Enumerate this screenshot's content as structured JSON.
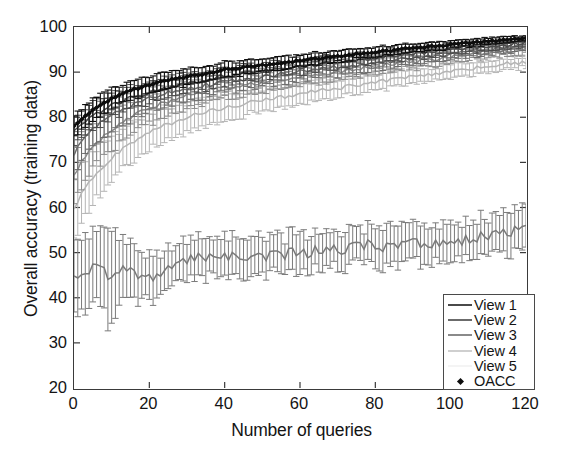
{
  "chart_data": {
    "type": "line",
    "title": "",
    "xlabel": "Number of queries",
    "ylabel": "Overall accuracy (training data)",
    "xlim": [
      0,
      120
    ],
    "ylim": [
      20,
      100
    ],
    "xticks": [
      0,
      20,
      40,
      60,
      80,
      100,
      120
    ],
    "yticks": [
      20,
      30,
      40,
      50,
      60,
      70,
      80,
      90,
      100
    ],
    "grid": false,
    "legend_position": "bottom-right",
    "error_bars": true,
    "error_bar_style": "vertical capped (std. deviation)",
    "x": [
      0,
      2,
      4,
      6,
      8,
      10,
      12,
      14,
      16,
      18,
      20,
      24,
      28,
      32,
      36,
      40,
      44,
      48,
      52,
      56,
      60,
      64,
      68,
      72,
      76,
      80,
      84,
      88,
      92,
      96,
      100,
      104,
      108,
      112,
      116,
      120
    ],
    "series": [
      {
        "name": "OACC",
        "color": "#0d0d0d",
        "marker": "diamond",
        "values": [
          78.0,
          79.6,
          81.0,
          82.2,
          83.2,
          84.1,
          84.9,
          85.6,
          86.2,
          86.7,
          87.2,
          88.0,
          88.7,
          89.3,
          89.8,
          90.6,
          90.9,
          91.4,
          91.7,
          92.2,
          92.5,
          92.9,
          93.3,
          93.7,
          94.1,
          94.5,
          94.8,
          95.2,
          95.5,
          95.8,
          96.1,
          96.4,
          96.7,
          96.9,
          97.2,
          97.4
        ],
        "err": [
          2.6,
          2.5,
          2.5,
          2.4,
          2.3,
          2.2,
          2.1,
          2.1,
          2.0,
          2.0,
          1.9,
          1.8,
          1.8,
          1.7,
          1.6,
          1.6,
          1.5,
          1.5,
          1.4,
          1.4,
          1.3,
          1.3,
          1.2,
          1.2,
          1.1,
          1.1,
          1.0,
          1.0,
          0.9,
          0.9,
          0.8,
          0.8,
          0.7,
          0.7,
          0.6,
          0.5
        ]
      },
      {
        "name": "View 1",
        "color": "#4a4a4a",
        "marker": "none",
        "values": [
          77.0,
          78.5,
          79.8,
          80.9,
          81.8,
          82.6,
          83.3,
          84.0,
          84.6,
          85.1,
          85.6,
          86.4,
          87.1,
          87.7,
          88.3,
          89.2,
          89.5,
          90.0,
          90.4,
          90.9,
          91.2,
          91.6,
          92.0,
          92.4,
          92.8,
          93.2,
          93.6,
          94.0,
          94.3,
          94.6,
          95.0,
          95.3,
          95.6,
          95.9,
          96.2,
          96.5
        ],
        "err": [
          3.2,
          3.1,
          3.0,
          2.9,
          2.8,
          2.7,
          2.6,
          2.5,
          2.4,
          2.4,
          2.3,
          2.2,
          2.1,
          2.0,
          2.0,
          1.9,
          1.8,
          1.8,
          1.7,
          1.6,
          1.6,
          1.5,
          1.5,
          1.4,
          1.3,
          1.3,
          1.2,
          1.2,
          1.1,
          1.1,
          1.0,
          1.0,
          0.9,
          0.8,
          0.8,
          0.7
        ]
      },
      {
        "name": "View 2",
        "color": "#6b6b6b",
        "marker": "none",
        "values": [
          72.0,
          74.5,
          76.5,
          78.0,
          79.3,
          80.4,
          81.4,
          82.2,
          83.0,
          83.6,
          84.2,
          85.2,
          86.0,
          86.7,
          87.3,
          87.9,
          88.3,
          88.8,
          89.2,
          89.7,
          90.1,
          90.5,
          90.9,
          91.3,
          91.7,
          92.1,
          92.5,
          92.9,
          93.2,
          93.6,
          93.9,
          94.3,
          94.7,
          95.0,
          95.4,
          95.7
        ],
        "err": [
          4.8,
          4.5,
          4.2,
          4.0,
          3.8,
          3.6,
          3.4,
          3.3,
          3.1,
          3.0,
          2.9,
          2.7,
          2.6,
          2.5,
          2.4,
          2.3,
          2.2,
          2.1,
          2.0,
          2.0,
          1.9,
          1.8,
          1.8,
          1.7,
          1.6,
          1.6,
          1.5,
          1.4,
          1.4,
          1.3,
          1.2,
          1.2,
          1.1,
          1.0,
          1.0,
          0.9
        ]
      },
      {
        "name": "View 3",
        "color": "#8a8a8a",
        "marker": "none",
        "values": [
          67.0,
          70.0,
          72.3,
          74.2,
          75.8,
          77.2,
          78.4,
          79.5,
          80.4,
          81.2,
          82.0,
          83.3,
          84.3,
          85.2,
          86.0,
          86.6,
          87.0,
          87.5,
          88.0,
          88.6,
          89.0,
          89.5,
          89.9,
          90.4,
          90.8,
          91.3,
          91.7,
          92.1,
          92.5,
          92.9,
          93.3,
          93.7,
          94.0,
          94.4,
          94.7,
          95.0
        ],
        "err": [
          6.0,
          5.6,
          5.2,
          4.9,
          4.6,
          4.3,
          4.1,
          3.9,
          3.7,
          3.5,
          3.4,
          3.1,
          2.9,
          2.8,
          2.6,
          2.5,
          2.4,
          2.3,
          2.2,
          2.1,
          2.0,
          1.9,
          1.9,
          1.8,
          1.7,
          1.6,
          1.6,
          1.5,
          1.4,
          1.4,
          1.3,
          1.2,
          1.2,
          1.1,
          1.0,
          1.0
        ]
      },
      {
        "name": "View 4",
        "color": "#b5b5b5",
        "marker": "none",
        "values": [
          60.0,
          63.0,
          65.5,
          67.6,
          69.4,
          71.0,
          72.4,
          73.6,
          74.7,
          75.7,
          76.6,
          78.1,
          79.4,
          80.5,
          81.4,
          82.2,
          82.8,
          83.4,
          84.0,
          84.6,
          85.1,
          85.7,
          86.2,
          86.7,
          87.2,
          87.7,
          88.2,
          88.7,
          89.2,
          89.7,
          90.1,
          90.6,
          91.0,
          91.5,
          91.9,
          92.3
        ],
        "err": [
          7.0,
          6.5,
          6.1,
          5.7,
          5.4,
          5.1,
          4.8,
          4.6,
          4.3,
          4.1,
          4.0,
          3.6,
          3.4,
          3.2,
          3.0,
          2.9,
          2.7,
          2.6,
          2.5,
          2.4,
          2.3,
          2.2,
          2.1,
          2.0,
          1.9,
          1.8,
          1.8,
          1.7,
          1.6,
          1.5,
          1.5,
          1.4,
          1.3,
          1.3,
          1.2,
          1.1
        ]
      },
      {
        "name": "View 5",
        "color": "#7a7a7a",
        "marker": "none",
        "values": [
          45.5,
          45.0,
          46.0,
          46.5,
          45.5,
          44.0,
          46.0,
          46.5,
          46.0,
          45.0,
          44.5,
          46.0,
          47.5,
          48.5,
          49.2,
          49.0,
          49.3,
          49.5,
          49.4,
          49.8,
          50.0,
          50.2,
          50.5,
          51.0,
          51.5,
          52.0,
          51.0,
          52.0,
          52.3,
          52.0,
          52.2,
          52.8,
          53.5,
          54.2,
          54.8,
          55.5
        ],
        "err": [
          9.5,
          9.0,
          8.0,
          7.5,
          8.5,
          11.0,
          6.5,
          6.0,
          5.5,
          5.0,
          4.8,
          4.6,
          4.5,
          4.4,
          4.3,
          4.4,
          4.2,
          4.3,
          4.2,
          4.1,
          4.2,
          4.1,
          4.0,
          4.1,
          4.0,
          4.2,
          4.5,
          4.0,
          4.1,
          4.0,
          4.1,
          4.2,
          4.3,
          4.4,
          4.5,
          5.0
        ]
      }
    ]
  },
  "axes": {
    "ylabel": "Overall accuracy (training data)",
    "xlabel": "Number of queries",
    "ytick_labels": [
      "100",
      "90",
      "80",
      "70",
      "60",
      "50",
      "40",
      "30",
      "20"
    ],
    "xtick_labels": [
      "0",
      "20",
      "40",
      "60",
      "80",
      "100",
      "120"
    ]
  },
  "legend": {
    "entries": [
      {
        "label": "View 1",
        "key": "line",
        "color": "#4a4a4a"
      },
      {
        "label": "View 2",
        "key": "line",
        "color": "#6b6b6b"
      },
      {
        "label": "View 3",
        "key": "line",
        "color": "#8a8a8a"
      },
      {
        "label": "View 4",
        "key": "line",
        "color": "#cccccc"
      },
      {
        "label": "View 5",
        "key": "line",
        "color": "#f2f2f2"
      },
      {
        "label": "OACC",
        "key": "diamond-marker",
        "color": "#0d0d0d"
      }
    ]
  }
}
